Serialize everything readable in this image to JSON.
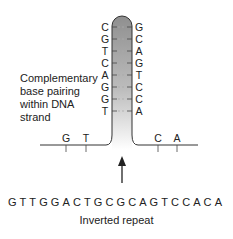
{
  "diagram": {
    "type": "dna-hairpin",
    "caption": "Complementary base pairing within DNA strand",
    "caption_lines": [
      "Complementary",
      "base pairing",
      "within DNA",
      "strand"
    ],
    "stem_left_bases": [
      "C",
      "G",
      "T",
      "C",
      "A",
      "G",
      "G",
      "T"
    ],
    "stem_right_bases": [
      "G",
      "C",
      "A",
      "G",
      "T",
      "C",
      "C",
      "A"
    ],
    "tail_left_bases": [
      "G",
      "T"
    ],
    "tail_right_bases": [
      "C",
      "A"
    ],
    "sequence": "GTTGGACTGCGCAGTCCACA",
    "sequence_label": "Inverted repeat",
    "colors": {
      "stem_fill_top": "#9a9a9a",
      "stem_fill_bottom": "#f2f2f2",
      "line": "#333333",
      "text": "#222222"
    }
  }
}
